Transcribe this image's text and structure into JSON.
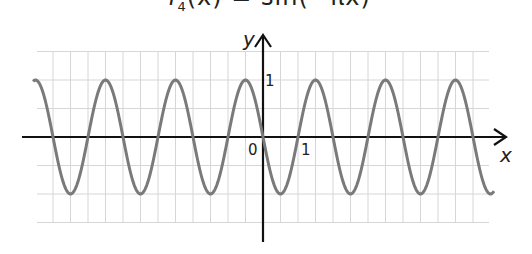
{
  "chart_data": {
    "type": "line",
    "title": "f4(x) = sin(−πx)",
    "function": "sin(-pi*x)",
    "xlabel": "x",
    "ylabel": "y",
    "xlim": [
      -6.5,
      6.5
    ],
    "ylim": [
      -1.5,
      1.5
    ],
    "grid": true,
    "grid_step_x": 0.5,
    "grid_step_y": 0.5,
    "tick_labels": {
      "origin": "0",
      "x": [
        "1"
      ],
      "y": [
        "1"
      ]
    },
    "period": 2,
    "amplitude": 1,
    "series": [
      {
        "name": "f4(x)",
        "x": [
          -6.5,
          -6,
          -5.5,
          -5,
          -4.5,
          -4,
          -3.5,
          -3,
          -2.5,
          -2,
          -1.5,
          -1,
          -0.5,
          0,
          0.5,
          1,
          1.5,
          2,
          2.5,
          3,
          3.5,
          4,
          4.5,
          5,
          5.5,
          6,
          6.5
        ],
        "values": [
          1,
          0,
          -1,
          0,
          1,
          0,
          -1,
          0,
          1,
          0,
          -1,
          0,
          1,
          0,
          -1,
          0,
          1,
          0,
          -1,
          0,
          1,
          0,
          -1,
          0,
          1,
          0,
          -1
        ]
      }
    ],
    "colors": {
      "curve": "#7a7a7a",
      "axes": "#111111",
      "grid": "#d4d4d4"
    }
  },
  "labels": {
    "title_main": "f",
    "title_sub": "4",
    "title_rest": "(x) = sin(−πx)",
    "x_axis": "x",
    "y_axis": "y",
    "origin": "0",
    "x_tick_1": "1",
    "y_tick_1": "1"
  }
}
